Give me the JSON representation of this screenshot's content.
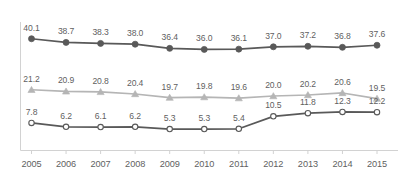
{
  "chart_data": {
    "type": "line",
    "title": "",
    "subtitle": "",
    "xlabel": "",
    "ylabel": "",
    "grid": false,
    "legend": "none",
    "axis": {
      "x_axis_line": true,
      "y_axis_line": true,
      "x_ticks": true,
      "y_tick_labels": false
    },
    "categories": [
      "2005",
      "2006",
      "2007",
      "2008",
      "2009",
      "2010",
      "2011",
      "2012",
      "2013",
      "2014",
      "2015"
    ],
    "series": [
      {
        "name": "series-1",
        "marker": "filled-circle",
        "color": "#595959",
        "line_color": "#595959",
        "values": [
          40.1,
          38.7,
          38.3,
          38.0,
          36.4,
          36.0,
          36.1,
          37.0,
          37.2,
          36.8,
          37.6
        ],
        "labels": [
          "40.1",
          "38.7",
          "38.3",
          "38.0",
          "36.4",
          "36.0",
          "36.1",
          "37.0",
          "37.2",
          "36.8",
          "37.6"
        ]
      },
      {
        "name": "series-2",
        "marker": "triangle",
        "color": "#b5b5b5",
        "line_color": "#b5b5b5",
        "values": [
          21.2,
          20.9,
          20.8,
          20.4,
          19.7,
          19.8,
          19.6,
          20.0,
          20.2,
          20.6,
          19.5
        ],
        "labels": [
          "21.2",
          "20.9",
          "20.8",
          "20.4",
          "19.7",
          "19.8",
          "19.6",
          "20.0",
          "20.2",
          "20.6",
          "19.5"
        ]
      },
      {
        "name": "series-3",
        "marker": "hollow-circle",
        "color": "#ffffff",
        "line_color": "#595959",
        "values": [
          7.8,
          6.2,
          6.1,
          6.2,
          5.3,
          5.3,
          5.4,
          10.5,
          11.8,
          12.3,
          12.2
        ],
        "labels": [
          "7.8",
          "6.2",
          "6.1",
          "6.2",
          "5.3",
          "5.3",
          "5.4",
          "10.5",
          "11.8",
          "12.3",
          "12.2"
        ]
      }
    ],
    "colors": {
      "dark_gray": "#595959",
      "light_gray": "#b5b5b5",
      "axis_gray": "#d2d2d2",
      "text_gray": "#5f5f5f"
    }
  }
}
